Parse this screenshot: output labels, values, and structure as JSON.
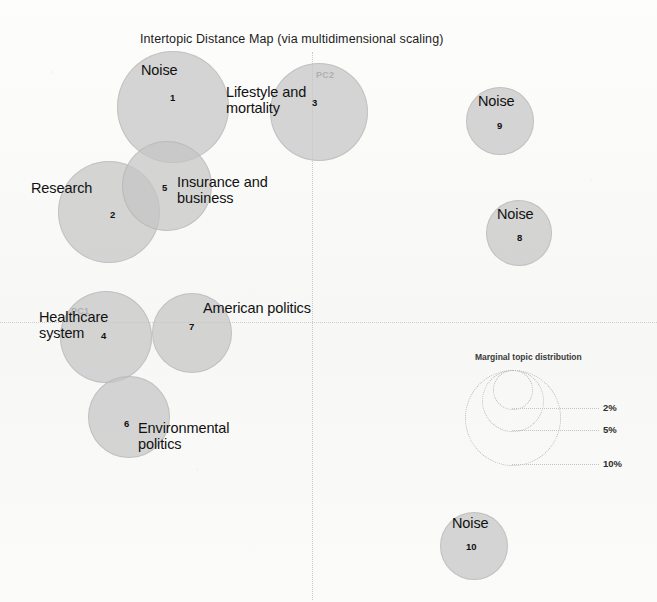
{
  "chart_data": {
    "type": "scatter",
    "title": "Intertopic Distance Map (via multidimensional scaling)",
    "xlabel": "PC1",
    "ylabel": "PC2",
    "axis_labels": {
      "x": "PC1",
      "y": "PC2"
    },
    "grid": false,
    "legend": {
      "position": "bottom-right",
      "title": "Marginal topic distribution",
      "entries": [
        {
          "label": "2%",
          "value": 2
        },
        {
          "label": "5%",
          "value": 5
        },
        {
          "label": "10%",
          "value": 10
        }
      ]
    },
    "points": [
      {
        "id": 1,
        "label": "Noise",
        "cx": 173,
        "cy": 107,
        "r": 56,
        "size_pct": 10.0
      },
      {
        "id": 2,
        "label": "Research",
        "cx": 109,
        "cy": 212,
        "r": 51,
        "size_pct": 8.5
      },
      {
        "id": 3,
        "label": "Lifestyle and\nmortality",
        "cx": 319,
        "cy": 112,
        "r": 49,
        "size_pct": 8.0
      },
      {
        "id": 4,
        "label": "Healthcare\nsystem",
        "cx": 106,
        "cy": 337,
        "r": 46,
        "size_pct": 7.0
      },
      {
        "id": 5,
        "label": "Insurance and\nbusiness",
        "cx": 167,
        "cy": 186,
        "r": 45,
        "size_pct": 6.8
      },
      {
        "id": 6,
        "label": "Environmental\npolitics",
        "cx": 129,
        "cy": 417,
        "r": 41,
        "size_pct": 5.6
      },
      {
        "id": 7,
        "label": "American politics",
        "cx": 192,
        "cy": 333,
        "r": 40,
        "size_pct": 5.4
      },
      {
        "id": 8,
        "label": "Noise",
        "cx": 519,
        "cy": 233,
        "r": 33,
        "size_pct": 3.7
      },
      {
        "id": 9,
        "label": "Noise",
        "cx": 500,
        "cy": 121,
        "r": 34,
        "size_pct": 3.9
      },
      {
        "id": 10,
        "label": "Noise",
        "cx": 474,
        "cy": 546,
        "r": 34,
        "size_pct": 3.9
      }
    ]
  },
  "topics": [
    {
      "number": "1",
      "label": "Noise",
      "label_x": 141,
      "label_y": 62,
      "num_x": 170,
      "num_y": 92
    },
    {
      "number": "2",
      "label": "Research",
      "label_x": 31,
      "label_y": 180,
      "num_x": 110,
      "num_y": 209
    },
    {
      "number": "3",
      "label": "Lifestyle and\nmortality",
      "label_x": 226,
      "label_y": 84,
      "num_x": 312,
      "num_y": 97
    },
    {
      "number": "4",
      "label": "Healthcare\nsystem",
      "label_x": 39,
      "label_y": 309,
      "num_x": 101,
      "num_y": 330
    },
    {
      "number": "5",
      "label": "Insurance and\nbusiness",
      "label_x": 177,
      "label_y": 174,
      "num_x": 162,
      "num_y": 182
    },
    {
      "number": "6",
      "label": "Environmental\npolitics",
      "label_x": 138,
      "label_y": 420,
      "num_x": 124,
      "num_y": 418
    },
    {
      "number": "7",
      "label": "American politics",
      "label_x": 203,
      "label_y": 300,
      "num_x": 189,
      "num_y": 321
    },
    {
      "number": "8",
      "label": "Noise",
      "label_x": 497,
      "label_y": 206,
      "num_x": 517,
      "num_y": 232
    },
    {
      "number": "9",
      "label": "Noise",
      "label_x": 478,
      "label_y": 93,
      "num_x": 497,
      "num_y": 120
    },
    {
      "number": "10",
      "label": "Noise",
      "label_x": 452,
      "label_y": 515,
      "num_x": 466,
      "num_y": 541
    }
  ]
}
